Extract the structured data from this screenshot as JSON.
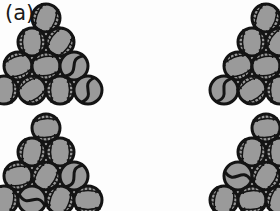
{
  "figure": {
    "panel_label": "(a)",
    "background_color": "#fdfdfd",
    "width": 280,
    "height": 211
  },
  "ball_style": {
    "fill_color": "#9a9a9a",
    "outline_color": "#141414",
    "seam_color": "#141414",
    "diameter": 32,
    "outline_width": 3
  },
  "groups": [
    {
      "name": "pyramid-top-left",
      "origin_x": 46,
      "origin_y": 2,
      "rows": 4,
      "ball_count": 10,
      "clipped": false,
      "balls": [
        {
          "row": 0,
          "col": 0,
          "seam": "baseball",
          "rotation": 20
        },
        {
          "row": 1,
          "col": 0,
          "seam": "baseball",
          "rotation": 0
        },
        {
          "row": 1,
          "col": 1,
          "seam": "baseball",
          "rotation": 35
        },
        {
          "row": 2,
          "col": 0,
          "seam": "baseball",
          "rotation": 70
        },
        {
          "row": 2,
          "col": 1,
          "seam": "baseball",
          "rotation": 80
        },
        {
          "row": 2,
          "col": 2,
          "seam": "curve",
          "rotation": 15
        },
        {
          "row": 3,
          "col": 0,
          "seam": "baseball",
          "rotation": 5
        },
        {
          "row": 3,
          "col": 1,
          "seam": "baseball",
          "rotation": 55
        },
        {
          "row": 3,
          "col": 2,
          "seam": "baseball",
          "rotation": 0
        },
        {
          "row": 3,
          "col": 3,
          "seam": "curve",
          "rotation": 0
        }
      ]
    },
    {
      "name": "pyramid-bottom-left",
      "origin_x": 46,
      "origin_y": 112,
      "rows": 4,
      "ball_count": 10,
      "clipped": false,
      "balls": [
        {
          "row": 0,
          "col": 0,
          "seam": "baseball",
          "rotation": 85
        },
        {
          "row": 1,
          "col": 0,
          "seam": "baseball",
          "rotation": 10
        },
        {
          "row": 1,
          "col": 1,
          "seam": "baseball",
          "rotation": 0
        },
        {
          "row": 2,
          "col": 0,
          "seam": "baseball",
          "rotation": 80
        },
        {
          "row": 2,
          "col": 1,
          "seam": "baseball",
          "rotation": 30
        },
        {
          "row": 2,
          "col": 2,
          "seam": "curve",
          "rotation": 10
        },
        {
          "row": 3,
          "col": 0,
          "seam": "baseball",
          "rotation": 10
        },
        {
          "row": 3,
          "col": 1,
          "seam": "curve",
          "rotation": 85
        },
        {
          "row": 3,
          "col": 2,
          "seam": "baseball",
          "rotation": 20
        },
        {
          "row": 3,
          "col": 3,
          "seam": "baseball",
          "rotation": 90
        }
      ]
    },
    {
      "name": "pyramid-top-right",
      "origin_x": 266,
      "origin_y": 2,
      "rows": 4,
      "ball_count": 10,
      "clipped": true,
      "balls": [
        {
          "row": 0,
          "col": 0,
          "seam": "baseball",
          "rotation": 20
        },
        {
          "row": 1,
          "col": 0,
          "seam": "baseball",
          "rotation": 0
        },
        {
          "row": 1,
          "col": 1,
          "seam": "baseball",
          "rotation": 35
        },
        {
          "row": 2,
          "col": 0,
          "seam": "baseball",
          "rotation": 70
        },
        {
          "row": 2,
          "col": 1,
          "seam": "baseball",
          "rotation": 80
        },
        {
          "row": 2,
          "col": 2,
          "seam": "curve",
          "rotation": 15
        },
        {
          "row": 3,
          "col": 0,
          "seam": "curve",
          "rotation": 5
        },
        {
          "row": 3,
          "col": 1,
          "seam": "baseball",
          "rotation": 55
        },
        {
          "row": 3,
          "col": 2,
          "seam": "baseball",
          "rotation": 0
        },
        {
          "row": 3,
          "col": 3,
          "seam": "curve",
          "rotation": 0
        }
      ]
    },
    {
      "name": "pyramid-bottom-right",
      "origin_x": 266,
      "origin_y": 112,
      "rows": 4,
      "ball_count": 10,
      "clipped": true,
      "balls": [
        {
          "row": 0,
          "col": 0,
          "seam": "baseball",
          "rotation": 85
        },
        {
          "row": 1,
          "col": 0,
          "seam": "baseball",
          "rotation": 10
        },
        {
          "row": 1,
          "col": 1,
          "seam": "baseball",
          "rotation": 0
        },
        {
          "row": 2,
          "col": 0,
          "seam": "curve",
          "rotation": 80
        },
        {
          "row": 2,
          "col": 1,
          "seam": "baseball",
          "rotation": 30
        },
        {
          "row": 2,
          "col": 2,
          "seam": "curve",
          "rotation": 10
        },
        {
          "row": 3,
          "col": 0,
          "seam": "baseball",
          "rotation": 10
        },
        {
          "row": 3,
          "col": 1,
          "seam": "baseball",
          "rotation": 85
        },
        {
          "row": 3,
          "col": 2,
          "seam": "baseball",
          "rotation": 20
        },
        {
          "row": 3,
          "col": 3,
          "seam": "baseball",
          "rotation": 90
        }
      ]
    }
  ]
}
